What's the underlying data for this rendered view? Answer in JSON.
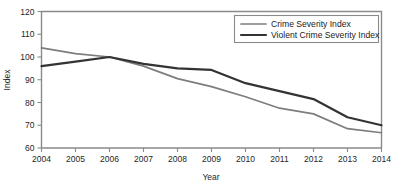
{
  "chart_data": {
    "type": "line",
    "title": "",
    "xlabel": "Year",
    "ylabel": "Index",
    "categories": [
      2004,
      2005,
      2006,
      2007,
      2008,
      2009,
      2010,
      2011,
      2012,
      2013,
      2014
    ],
    "x": [
      2004,
      2005,
      2006,
      2007,
      2008,
      2009,
      2010,
      2011,
      2012,
      2013,
      2014
    ],
    "xlim": [
      2004,
      2014
    ],
    "ylim": [
      60,
      120
    ],
    "y_ticks": [
      60,
      70,
      80,
      90,
      100,
      110,
      120
    ],
    "x_ticks": [
      "2004",
      "2005",
      "2006",
      "2007",
      "2008",
      "2009",
      "2010",
      "2011",
      "2012",
      "2013",
      "2014"
    ],
    "grid": false,
    "legend_position": "top-right",
    "series": [
      {
        "name": "Crime Severity Index",
        "color": "#7d7d7d",
        "values": [
          104,
          101.5,
          100,
          96,
          90.5,
          87,
          82.5,
          77.5,
          75,
          68.5,
          66.7
        ]
      },
      {
        "name": "Violent Crime Severity Index",
        "color": "#333333",
        "values": [
          96,
          98,
          100,
          97,
          95,
          94.3,
          88.5,
          85,
          81.5,
          73.5,
          70
        ]
      }
    ]
  },
  "legend": {
    "items": [
      {
        "label": "Crime Severity Index",
        "color": "#7d7d7d"
      },
      {
        "label": "Violent Crime Severity Index",
        "color": "#333333"
      }
    ]
  },
  "axes": {
    "y_title": "Index",
    "x_title": "Year"
  }
}
